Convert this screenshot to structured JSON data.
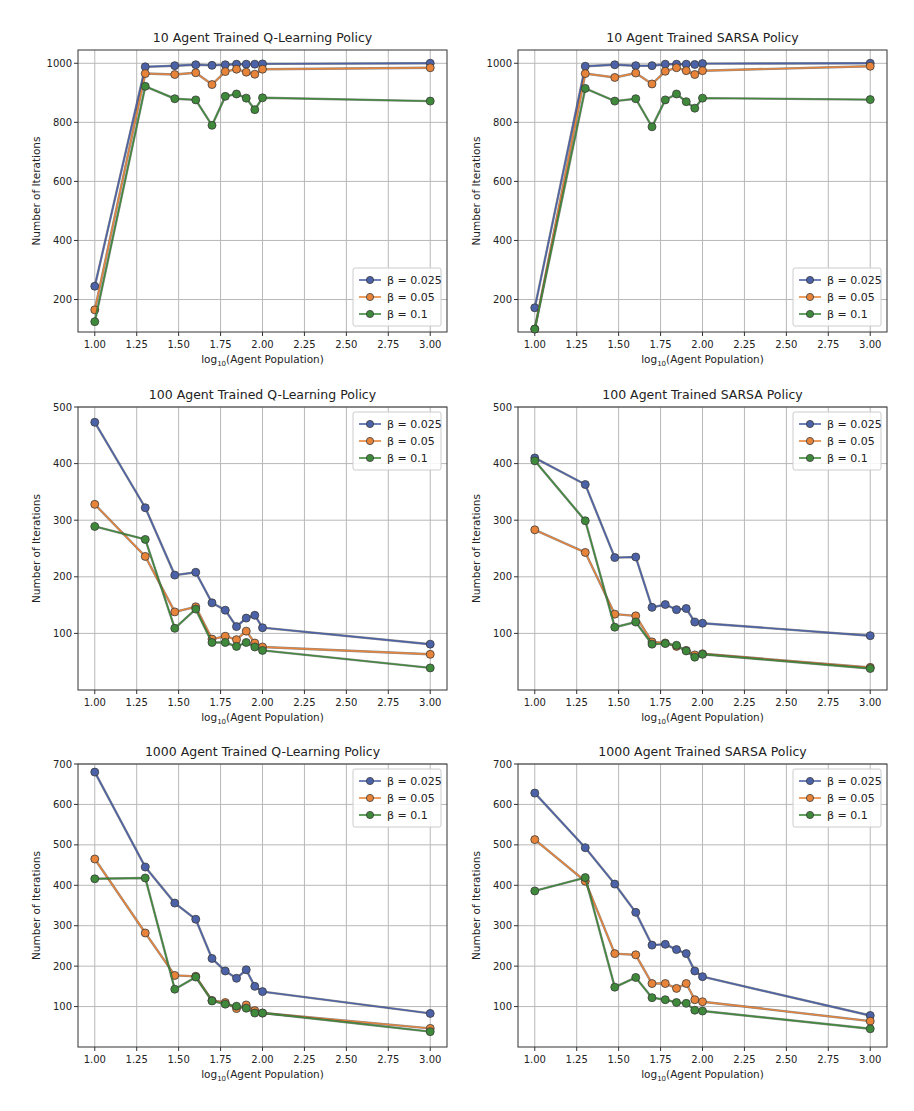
{
  "figure": {
    "xlabel": "log10(Agent Population)",
    "ylabel": "Number of Iterations",
    "colors": {
      "beta_0.025": "#4c62a8",
      "beta_0.05": "#e8843a",
      "beta_0.1": "#3e8a3a",
      "grid": "#b8b8b8",
      "axis": "#333333"
    }
  },
  "chart_data": [
    {
      "type": "line",
      "title": "10 Agent Trained Q-Learning Policy",
      "xlabel": "log10(Agent Population)",
      "ylabel": "Number of Iterations",
      "x": [
        1.0,
        1.301,
        1.477,
        1.602,
        1.699,
        1.778,
        1.845,
        1.903,
        1.954,
        2.0,
        3.0
      ],
      "xticks": [
        "1.00",
        "1.25",
        "1.50",
        "1.75",
        "2.00",
        "2.25",
        "2.50",
        "2.75",
        "3.00"
      ],
      "yticks": [
        200,
        400,
        600,
        800,
        1000
      ],
      "ylim": [
        90,
        1045
      ],
      "grid": true,
      "legend_position": "lower right",
      "series": [
        {
          "name": "β = 0.025",
          "values": [
            245,
            988,
            992,
            995,
            993,
            995,
            997,
            997,
            997,
            998,
            1000
          ]
        },
        {
          "name": "β = 0.05",
          "values": [
            165,
            965,
            962,
            968,
            928,
            972,
            980,
            970,
            963,
            980,
            985
          ]
        },
        {
          "name": "β = 0.1",
          "values": [
            125,
            922,
            880,
            876,
            790,
            888,
            896,
            882,
            843,
            883,
            872
          ]
        }
      ]
    },
    {
      "type": "line",
      "title": "10 Agent Trained SARSA Policy",
      "xlabel": "log10(Agent Population)",
      "ylabel": "Number of Iterations",
      "x": [
        1.0,
        1.301,
        1.477,
        1.602,
        1.699,
        1.778,
        1.845,
        1.903,
        1.954,
        2.0,
        3.0
      ],
      "xticks": [
        "1.00",
        "1.25",
        "1.50",
        "1.75",
        "2.00",
        "2.25",
        "2.50",
        "2.75",
        "3.00"
      ],
      "yticks": [
        200,
        400,
        600,
        800,
        1000
      ],
      "ylim": [
        90,
        1045
      ],
      "grid": true,
      "legend_position": "lower right",
      "series": [
        {
          "name": "β = 0.025",
          "values": [
            172,
            990,
            995,
            992,
            992,
            997,
            997,
            997,
            996,
            999,
            1000
          ]
        },
        {
          "name": "β = 0.05",
          "values": [
            100,
            965,
            952,
            967,
            930,
            973,
            985,
            975,
            962,
            975,
            990
          ]
        },
        {
          "name": "β = 0.1",
          "values": [
            100,
            915,
            872,
            880,
            785,
            876,
            896,
            870,
            848,
            882,
            877
          ]
        }
      ]
    },
    {
      "type": "line",
      "title": "100 Agent Trained Q-Learning Policy",
      "xlabel": "log10(Agent Population)",
      "ylabel": "Number of Iterations",
      "x": [
        1.0,
        1.301,
        1.477,
        1.602,
        1.699,
        1.778,
        1.845,
        1.903,
        1.954,
        2.0,
        3.0
      ],
      "xticks": [
        "1.00",
        "1.25",
        "1.50",
        "1.75",
        "2.00",
        "2.25",
        "2.50",
        "2.75",
        "3.00"
      ],
      "yticks": [
        100,
        200,
        300,
        400,
        500
      ],
      "ylim": [
        0,
        500
      ],
      "grid": true,
      "legend_position": "upper right",
      "series": [
        {
          "name": "β = 0.025",
          "values": [
            473,
            322,
            203,
            208,
            154,
            141,
            112,
            127,
            132,
            110,
            81
          ]
        },
        {
          "name": "β = 0.05",
          "values": [
            328,
            236,
            138,
            147,
            90,
            95,
            89,
            104,
            83,
            76,
            63
          ]
        },
        {
          "name": "β = 0.1",
          "values": [
            289,
            266,
            109,
            143,
            84,
            84,
            77,
            84,
            76,
            70,
            39
          ]
        }
      ]
    },
    {
      "type": "line",
      "title": "100 Agent Trained SARSA Policy",
      "xlabel": "log10(Agent Population)",
      "ylabel": "Number of Iterations",
      "x": [
        1.0,
        1.301,
        1.477,
        1.602,
        1.699,
        1.778,
        1.845,
        1.903,
        1.954,
        2.0,
        3.0
      ],
      "xticks": [
        "1.00",
        "1.25",
        "1.50",
        "1.75",
        "2.00",
        "2.25",
        "2.50",
        "2.75",
        "3.00"
      ],
      "yticks": [
        100,
        200,
        300,
        400,
        500
      ],
      "ylim": [
        0,
        500
      ],
      "grid": true,
      "legend_position": "upper right",
      "series": [
        {
          "name": "β = 0.025",
          "values": [
            410,
            363,
            234,
            235,
            146,
            151,
            142,
            144,
            120,
            118,
            96
          ]
        },
        {
          "name": "β = 0.05",
          "values": [
            283,
            243,
            134,
            131,
            85,
            83,
            77,
            70,
            62,
            64,
            40
          ]
        },
        {
          "name": "β = 0.1",
          "values": [
            405,
            299,
            111,
            120,
            81,
            82,
            79,
            69,
            58,
            63,
            38
          ]
        }
      ]
    },
    {
      "type": "line",
      "title": "1000 Agent Trained Q-Learning Policy",
      "xlabel": "log10(Agent Population)",
      "ylabel": "Number of Iterations",
      "x": [
        1.0,
        1.301,
        1.477,
        1.602,
        1.699,
        1.778,
        1.845,
        1.903,
        1.954,
        2.0,
        3.0
      ],
      "xticks": [
        "1.00",
        "1.25",
        "1.50",
        "1.75",
        "2.00",
        "2.25",
        "2.50",
        "2.75",
        "3.00"
      ],
      "yticks": [
        100,
        200,
        300,
        400,
        500,
        600,
        700
      ],
      "ylim": [
        0,
        700
      ],
      "grid": true,
      "legend_position": "upper right",
      "series": [
        {
          "name": "β = 0.025",
          "values": [
            680,
            445,
            356,
            316,
            219,
            188,
            170,
            191,
            150,
            137,
            83
          ]
        },
        {
          "name": "β = 0.05",
          "values": [
            465,
            282,
            177,
            175,
            115,
            110,
            95,
            104,
            90,
            84,
            46
          ]
        },
        {
          "name": "β = 0.1",
          "values": [
            416,
            418,
            143,
            173,
            114,
            106,
            101,
            96,
            84,
            84,
            38
          ]
        }
      ]
    },
    {
      "type": "line",
      "title": "1000 Agent Trained SARSA Policy",
      "xlabel": "log10(Agent Population)",
      "ylabel": "Number of Iterations",
      "x": [
        1.0,
        1.301,
        1.477,
        1.602,
        1.699,
        1.778,
        1.845,
        1.903,
        1.954,
        2.0,
        3.0
      ],
      "xticks": [
        "1.00",
        "1.25",
        "1.50",
        "1.75",
        "2.00",
        "2.25",
        "2.50",
        "2.75",
        "3.00"
      ],
      "yticks": [
        100,
        200,
        300,
        400,
        500,
        600,
        700
      ],
      "ylim": [
        0,
        700
      ],
      "grid": true,
      "legend_position": "upper right",
      "series": [
        {
          "name": "β = 0.025",
          "values": [
            628,
            493,
            403,
            333,
            252,
            254,
            241,
            231,
            188,
            174,
            78
          ]
        },
        {
          "name": "β = 0.05",
          "values": [
            513,
            410,
            231,
            228,
            157,
            157,
            145,
            157,
            117,
            112,
            64
          ]
        },
        {
          "name": "β = 0.1",
          "values": [
            386,
            419,
            148,
            172,
            122,
            117,
            110,
            108,
            91,
            89,
            45
          ]
        }
      ]
    }
  ]
}
